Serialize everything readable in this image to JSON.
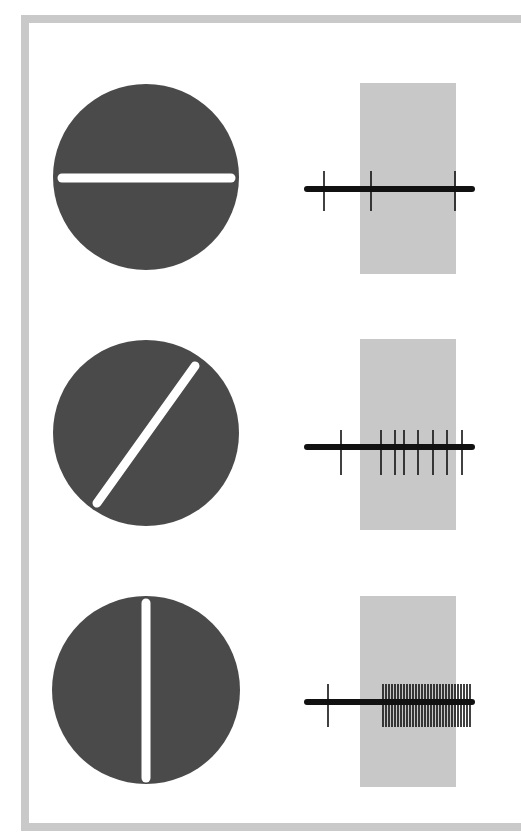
{
  "figure": {
    "colors": {
      "frame": "#c9c9c9",
      "receptive_field": "#4a4a4a",
      "bar": "#ffffff",
      "stimulus_window": "#c8c8c8",
      "trace": "#111111"
    },
    "rows": [
      {
        "name": "horizontal",
        "orientation_deg": 0,
        "circle": {
          "cx": 146,
          "cy": 177,
          "r": 93
        },
        "bar": {
          "x1": 62,
          "y1": 178,
          "x2": 231,
          "y2": 178
        },
        "window": {
          "x": 360,
          "y": 83,
          "w": 96,
          "h": 191
        },
        "trace": {
          "x_start": 307,
          "x_end": 472,
          "y": 189,
          "spike_top": 171,
          "spike_bottom": 211
        },
        "spikes_x": [
          324,
          371,
          455
        ]
      },
      {
        "name": "diagonal",
        "orientation_deg": 55,
        "circle": {
          "cx": 146,
          "cy": 433,
          "r": 93
        },
        "bar": {
          "x1": 97,
          "y1": 503,
          "x2": 195,
          "y2": 366
        },
        "window": {
          "x": 360,
          "y": 339,
          "w": 96,
          "h": 191
        },
        "trace": {
          "x_start": 307,
          "x_end": 472,
          "y": 447,
          "spike_top": 430,
          "spike_bottom": 475
        },
        "spikes_x": [
          341,
          381,
          395,
          404,
          418,
          433,
          447,
          462
        ]
      },
      {
        "name": "vertical",
        "orientation_deg": 90,
        "circle": {
          "cx": 146,
          "cy": 690,
          "r": 94
        },
        "bar": {
          "x1": 146,
          "y1": 603,
          "x2": 146,
          "y2": 778
        },
        "window": {
          "x": 360,
          "y": 596,
          "w": 96,
          "h": 191
        },
        "trace": {
          "x_start": 307,
          "x_end": 472,
          "y": 702,
          "spike_top": 684,
          "spike_bottom": 727
        },
        "spikes_x": [
          328,
          383,
          386,
          389,
          392,
          395,
          398,
          401,
          404,
          407,
          410,
          413,
          416,
          419,
          422,
          425,
          428,
          431,
          434,
          437,
          440,
          443,
          446,
          449,
          452,
          455,
          458,
          461,
          464,
          467,
          470
        ]
      }
    ]
  }
}
